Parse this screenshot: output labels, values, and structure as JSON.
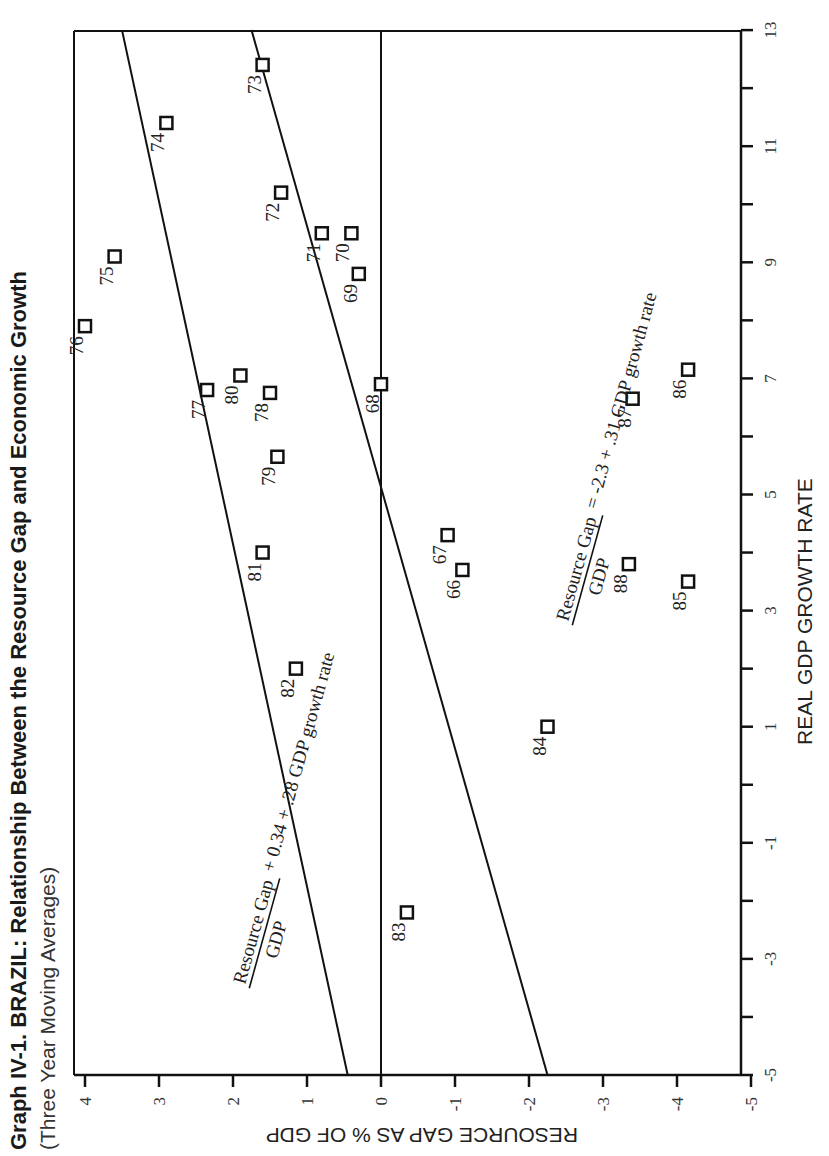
{
  "chart_data": {
    "type": "scatter",
    "title": "Graph IV-1. BRAZIL: Relationship Between the Resource Gap and Economic Growth",
    "subtitle": "(Three Year Moving Averages)",
    "xlabel": "REAL GDP GROWTH RATE",
    "ylabel": "RESOURCE GAP AS % OF GDP",
    "xlim": [
      -5,
      13
    ],
    "ylim": [
      -5,
      4
    ],
    "x_ticks": [
      -5,
      -3,
      -1,
      1,
      3,
      5,
      7,
      9,
      11,
      13
    ],
    "x_minor_ticks": [
      -4,
      -2,
      0,
      2,
      4,
      6,
      8,
      10,
      12
    ],
    "y_ticks": [
      4,
      3,
      2,
      1,
      0,
      -1,
      -2,
      -3,
      -4,
      -5
    ],
    "grid": false,
    "orientation": "rotated-90",
    "series": [
      {
        "name": "Annual observations (year)",
        "marker": "open-square",
        "points": [
          {
            "label": "66",
            "x": 3.7,
            "y": -1.1
          },
          {
            "label": "67",
            "x": 4.3,
            "y": -0.9
          },
          {
            "label": "68",
            "x": 6.9,
            "y": 0.0
          },
          {
            "label": "69",
            "x": 8.8,
            "y": 0.3
          },
          {
            "label": "70",
            "x": 9.5,
            "y": 0.4
          },
          {
            "label": "71",
            "x": 9.5,
            "y": 0.8
          },
          {
            "label": "72",
            "x": 10.2,
            "y": 1.35
          },
          {
            "label": "73",
            "x": 12.4,
            "y": 1.6
          },
          {
            "label": "74",
            "x": 11.4,
            "y": 2.9
          },
          {
            "label": "75",
            "x": 9.1,
            "y": 3.6
          },
          {
            "label": "76",
            "x": 7.9,
            "y": 4.0
          },
          {
            "label": "77",
            "x": 6.8,
            "y": 2.35
          },
          {
            "label": "78",
            "x": 6.75,
            "y": 1.5
          },
          {
            "label": "79",
            "x": 5.65,
            "y": 1.4
          },
          {
            "label": "80",
            "x": 7.05,
            "y": 1.9
          },
          {
            "label": "81",
            "x": 4.0,
            "y": 1.6
          },
          {
            "label": "82",
            "x": 2.0,
            "y": 1.15
          },
          {
            "label": "83",
            "x": -2.2,
            "y": -0.35
          },
          {
            "label": "84",
            "x": 1.0,
            "y": -2.25
          },
          {
            "label": "85",
            "x": 3.5,
            "y": -4.15
          },
          {
            "label": "86",
            "x": 7.15,
            "y": -4.15
          },
          {
            "label": "87",
            "x": 6.65,
            "y": -3.4
          },
          {
            "label": "88",
            "x": 3.8,
            "y": -3.35
          }
        ]
      }
    ],
    "lines": [
      {
        "name": "upper-fit-line",
        "from": {
          "x": -5,
          "y": 0.45
        },
        "to": {
          "x": 13,
          "y": 3.5
        },
        "annotation": {
          "numerator": "Resource Gap",
          "denominator": "GDP",
          "rhs": "+ 0.34 + .28 GDP growth rate"
        }
      },
      {
        "name": "lower-fit-line",
        "from": {
          "x": -5,
          "y": -2.25
        },
        "to": {
          "x": 13,
          "y": 1.75
        },
        "annotation": {
          "numerator": "Resource Gap",
          "denominator": "GDP",
          "rhs": "= -2.3 + .31 GDP growth rate"
        }
      },
      {
        "name": "zero-line",
        "from": {
          "x": -5,
          "y": 0
        },
        "to": {
          "x": 13,
          "y": 0
        }
      }
    ]
  }
}
